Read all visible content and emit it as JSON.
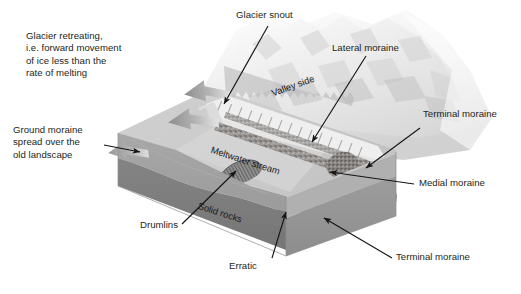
{
  "diagram": {
    "title_semantic": "glacial-retreat-landform-block-diagram",
    "background": "#ffffff",
    "ink": "#231f20"
  },
  "callouts": {
    "glacier_retreating": "Glacier retreating,\ni.e. forward movement\nof ice less than the\nrate of melting",
    "ground_moraine": "Ground moraine\nspread over the\nold landscape",
    "glacier_snout": "Glacier snout",
    "lateral_moraine": "Lateral moraine",
    "terminal_moraine_top": "Terminal moraine",
    "medial_moraine": "Medial moraine",
    "terminal_moraine_bottom": "Terminal moraine",
    "drumlins": "Drumlins",
    "erratic": "Erratic"
  },
  "scene_labels": {
    "valley_side": "Valley side",
    "meltwater_stream": "Meltwater stream",
    "solid_rocks": "Solid rocks"
  },
  "colors": {
    "ground_moraine_top": "#b9b9b9",
    "ground_moraine_face": "#9a9a9a",
    "solid_rock_face": "#7d7d7d",
    "valley_floor": "#c9c9c9",
    "valley_floor_light": "#d8d8d8",
    "moraine_rubble": "#8e8a86",
    "glacier_ice": "#e8e8e8",
    "glacier_shadow": "#c4c4c4",
    "arrow_gray": "#9b9b9b",
    "leader_line": "#1a1a1a",
    "block_edge": "#8a8a8a"
  },
  "features": {
    "meltwater_arrows_count": 2,
    "drumlin_count": 1,
    "erratic_count": 1
  }
}
